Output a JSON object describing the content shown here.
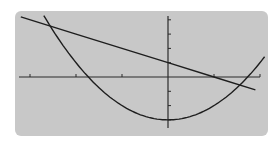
{
  "chart_data": {
    "type": "line",
    "title": "",
    "xlabel": "",
    "ylabel": "",
    "grid": false,
    "legend": null,
    "xlim": [
      -3.3,
      2.2
    ],
    "ylim": [
      -3.6,
      4.4
    ],
    "x_ticks": [
      -3,
      -2,
      -1,
      1,
      2
    ],
    "y_ticks": [
      -3,
      -2,
      -1,
      1,
      2,
      3,
      4
    ],
    "series": [
      {
        "name": "line",
        "equation": "y = -x + 1",
        "x": [
          -3.2,
          -2,
          -1,
          0,
          1,
          1.9
        ],
        "y": [
          4.2,
          3,
          2,
          1,
          0,
          -0.9
        ]
      },
      {
        "name": "parabola",
        "equation": "y = x^2 - 3",
        "x": [
          -2.7,
          -2,
          -1.73,
          -1,
          0,
          1,
          1.73,
          2.1
        ],
        "y": [
          4.29,
          1,
          0,
          -2,
          -3,
          -2,
          0,
          1.41
        ]
      }
    ],
    "intersections": [
      {
        "x": -2.56,
        "y": 3.56
      },
      {
        "x": 1.56,
        "y": -0.56
      }
    ]
  },
  "style": {
    "panel_color": "#c8c8c8",
    "curve_color": "#1e1e1e",
    "axis_color": "#2a2a2a",
    "background": "#ffffff"
  }
}
